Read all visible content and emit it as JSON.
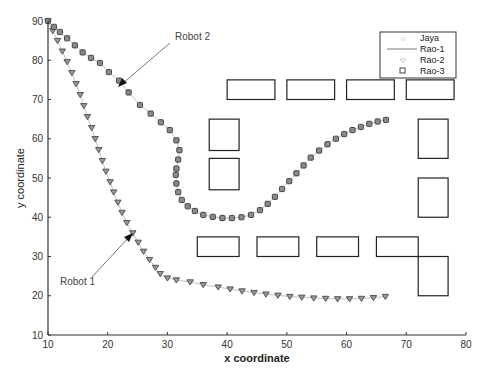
{
  "chart_data": {
    "type": "scatter",
    "title": "",
    "xlabel": "x coordinate",
    "ylabel": "y coordinate",
    "xlim": [
      10,
      80
    ],
    "ylim": [
      10,
      90
    ],
    "xticks": [
      10,
      20,
      30,
      40,
      50,
      60,
      70,
      80
    ],
    "yticks": [
      10,
      20,
      30,
      40,
      50,
      60,
      70,
      80,
      90
    ],
    "grid": false,
    "legend": {
      "position": "upper right",
      "entries": [
        {
          "label": "Jaya",
          "marker": "star"
        },
        {
          "label": "Rao-1",
          "marker": "line"
        },
        {
          "label": "Rao-2",
          "marker": "triangle-down"
        },
        {
          "label": "Rao-3",
          "marker": "square"
        }
      ]
    },
    "annotations": [
      {
        "text": "Robot 1",
        "text_xy": [
          15.5,
          27.5
        ],
        "arrow_to": [
          24.5,
          35.5
        ]
      },
      {
        "text": "Robot 2",
        "text_xy": [
          31,
          85
        ],
        "arrow_to": [
          21.9,
          73.4
        ]
      }
    ],
    "series": [
      {
        "name": "Robot 1 path",
        "marker": "triangle-down",
        "x": [
          10.0,
          10.8,
          11.6,
          12.4,
          13.2,
          14.0,
          14.7,
          15.4,
          16.0,
          16.6,
          17.3,
          17.9,
          18.5,
          19.1,
          19.7,
          20.4,
          21.0,
          21.7,
          22.4,
          23.2,
          24.2,
          25.1,
          26.0,
          27.0,
          28.0,
          28.8,
          30.0,
          31.5,
          33.8,
          36.0,
          38.5,
          40.5,
          42.5,
          44.5,
          46.5,
          48.5,
          50.5,
          52.5,
          54.5,
          56.5,
          58.5,
          60.5,
          62.5,
          64.5,
          66.5
        ],
        "y": [
          90.0,
          87.5,
          85.0,
          82.3,
          79.6,
          76.8,
          74.0,
          71.2,
          68.4,
          65.6,
          62.8,
          60.0,
          57.2,
          54.4,
          51.7,
          49.0,
          46.4,
          43.8,
          41.2,
          38.6,
          36.0,
          33.6,
          31.3,
          29.2,
          27.2,
          25.6,
          24.5,
          24.0,
          23.5,
          22.8,
          22.2,
          21.7,
          21.2,
          20.8,
          20.4,
          20.1,
          19.8,
          19.6,
          19.4,
          19.3,
          19.2,
          19.2,
          19.3,
          19.5,
          19.8
        ]
      },
      {
        "name": "Robot 2 path",
        "marker": "square",
        "x": [
          10.0,
          11.0,
          12.0,
          13.2,
          14.5,
          15.8,
          17.2,
          18.7,
          20.2,
          21.9,
          23.5,
          25.4,
          27.2,
          28.9,
          30.4,
          31.5,
          32.0,
          31.8,
          31.5,
          31.4,
          31.5,
          31.8,
          32.4,
          33.4,
          34.6,
          36.0,
          37.6,
          39.2,
          40.8,
          42.4,
          44.0,
          45.5,
          46.8,
          48.0,
          49.2,
          50.4,
          51.6,
          52.8,
          54.0,
          55.4,
          56.8,
          58.2,
          59.6,
          61.0,
          62.4,
          63.8,
          65.2,
          66.6
        ],
        "y": [
          90.0,
          88.5,
          87.2,
          85.6,
          83.8,
          82.0,
          80.6,
          79.3,
          77.0,
          74.8,
          71.8,
          68.6,
          66.4,
          64.2,
          62.2,
          59.6,
          57.1,
          54.7,
          52.4,
          50.8,
          48.6,
          46.4,
          44.4,
          42.8,
          41.6,
          40.6,
          40.1,
          39.8,
          39.8,
          40.0,
          40.6,
          41.8,
          43.4,
          45.2,
          47.2,
          49.2,
          51.2,
          53.2,
          55.2,
          57.0,
          58.6,
          60.0,
          61.2,
          62.2,
          63.0,
          63.8,
          64.4,
          64.8
        ]
      }
    ],
    "obstacles": [
      {
        "x": [
          40,
          48
        ],
        "y": [
          70,
          75
        ]
      },
      {
        "x": [
          50,
          58
        ],
        "y": [
          70,
          75
        ]
      },
      {
        "x": [
          60,
          68
        ],
        "y": [
          70,
          75
        ]
      },
      {
        "x": [
          70,
          78
        ],
        "y": [
          70,
          75
        ]
      },
      {
        "x": [
          37,
          42
        ],
        "y": [
          57,
          65
        ]
      },
      {
        "x": [
          37,
          42
        ],
        "y": [
          47,
          55
        ]
      },
      {
        "x": [
          72,
          77
        ],
        "y": [
          55,
          65
        ]
      },
      {
        "x": [
          72,
          77
        ],
        "y": [
          40,
          50
        ]
      },
      {
        "x": [
          35,
          42
        ],
        "y": [
          30,
          35
        ]
      },
      {
        "x": [
          45,
          52
        ],
        "y": [
          30,
          35
        ]
      },
      {
        "x": [
          55,
          62
        ],
        "y": [
          30,
          35
        ]
      },
      {
        "x": [
          65,
          72
        ],
        "y": [
          30,
          35
        ]
      },
      {
        "x": [
          72,
          77
        ],
        "y": [
          20,
          30
        ]
      }
    ]
  },
  "labels": {
    "xlabel": "x coordinate",
    "ylabel": "y coordinate",
    "robot1": "Robot 1",
    "robot2": "Robot 2",
    "legend": [
      "Jaya",
      "Rao-1",
      "Rao-2",
      "Rao-3"
    ]
  }
}
